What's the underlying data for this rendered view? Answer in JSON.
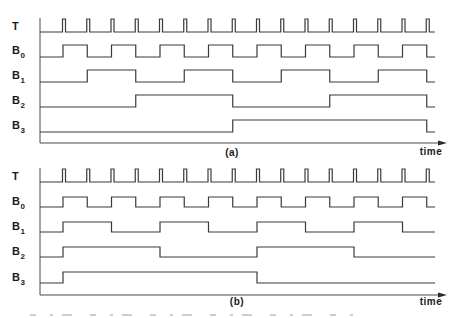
{
  "figure": {
    "clock": {
      "first_pulse_x": 62.5,
      "period": 24.25,
      "pulse_width": 3,
      "count": 16
    },
    "x_start": 40,
    "x_end": 435,
    "axis_arrow_tip": 447,
    "line_color": "#3a3a3a",
    "panels": [
      {
        "id": "a",
        "caption": "(a)",
        "caption_pos": [
          232,
          156
        ],
        "time_label": "time",
        "time_label_pos": [
          431,
          155
        ],
        "axis_top": 18,
        "axis_y": 143,
        "clock_row": {
          "label": "T",
          "label_y": 30,
          "base_y": 32,
          "top_y": 19
        },
        "rows": [
          {
            "label": "B",
            "sub": "0",
            "label_y": 54,
            "low_y": 57,
            "high_y": 45,
            "initial": 0,
            "toggles": [
              1,
              2,
              3,
              4,
              5,
              6,
              7,
              8,
              9,
              10,
              11,
              12,
              13,
              14,
              15,
              16
            ]
          },
          {
            "label": "B",
            "sub": "1",
            "label_y": 79,
            "low_y": 82,
            "high_y": 70,
            "initial": 0,
            "toggles": [
              2,
              4,
              6,
              8,
              10,
              12,
              14,
              16
            ]
          },
          {
            "label": "B",
            "sub": "2",
            "label_y": 104,
            "low_y": 107,
            "high_y": 95,
            "initial": 0,
            "toggles": [
              4,
              8,
              12,
              16
            ]
          },
          {
            "label": "B",
            "sub": "3",
            "label_y": 129,
            "low_y": 132,
            "high_y": 120,
            "initial": 0,
            "toggles": [
              8,
              16
            ]
          }
        ]
      },
      {
        "id": "b",
        "caption": "(b)",
        "caption_pos": [
          237,
          305
        ],
        "time_label": "time",
        "time_label_pos": [
          431,
          305
        ],
        "axis_top": 168,
        "axis_y": 295,
        "clock_row": {
          "label": "T",
          "label_y": 180,
          "base_y": 182,
          "top_y": 169
        },
        "rows": [
          {
            "label": "B",
            "sub": "0",
            "label_y": 205,
            "low_y": 207,
            "high_y": 197,
            "initial": 0,
            "toggles": [
              1,
              2,
              3,
              4,
              5,
              6,
              7,
              8,
              9,
              10,
              11,
              12,
              13,
              14,
              15,
              16
            ]
          },
          {
            "label": "B",
            "sub": "1",
            "label_y": 230,
            "low_y": 232,
            "high_y": 222,
            "initial": 0,
            "toggles": [
              1,
              3,
              5,
              7,
              9,
              11,
              13,
              15
            ]
          },
          {
            "label": "B",
            "sub": "2",
            "label_y": 255,
            "low_y": 257,
            "high_y": 247,
            "initial": 0,
            "toggles": [
              1,
              5,
              9,
              13
            ]
          },
          {
            "label": "B",
            "sub": "3",
            "label_y": 281,
            "low_y": 283,
            "high_y": 272,
            "initial": 0,
            "toggles": [
              1,
              9
            ]
          }
        ]
      }
    ],
    "caption_fragment_y": 315
  }
}
